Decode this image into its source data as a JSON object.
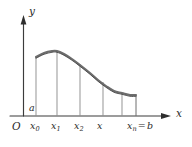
{
  "figure": {
    "axes": {
      "y_label": "y",
      "x_label": "x",
      "origin_label": "O"
    },
    "labels": {
      "lower_limit": "a",
      "tick_0_base": "x",
      "tick_0_sub": "0",
      "tick_1_base": "x",
      "tick_1_sub": "1",
      "tick_2_base": "x",
      "tick_2_sub": "2",
      "tick_3_base": "x",
      "tick_n_base": "x",
      "tick_n_sub": "n",
      "equals": "=",
      "upper_limit": "b"
    },
    "colors": {
      "background": "#ffffff",
      "axis": "#3b3b3b",
      "ordinate": "#8e8e8e",
      "curve_outer": "#6d6d6d",
      "curve_inner": "#3f3f3f",
      "text": "#2b2b2b"
    }
  },
  "chart_data": {
    "type": "line",
    "title": "",
    "xlabel": "x",
    "ylabel": "y",
    "xlim": [
      0,
      192
    ],
    "ylim": [
      0,
      147
    ],
    "grid": false,
    "legend": null,
    "x_tick_labels": [
      "x0",
      "x1",
      "x2",
      "x3",
      "xn = b"
    ],
    "x_tick_positions": [
      36,
      57,
      80,
      103,
      136
    ],
    "ordinate_positions": [
      36,
      57,
      80,
      103,
      122,
      136
    ],
    "ordinate_top_y": [
      57,
      52,
      64,
      82,
      93,
      95
    ],
    "axis_baseline_y": 116,
    "curve_points": [
      {
        "x": 36,
        "y": 57
      },
      {
        "x": 44,
        "y": 53
      },
      {
        "x": 52,
        "y": 51
      },
      {
        "x": 57,
        "y": 51
      },
      {
        "x": 64,
        "y": 54
      },
      {
        "x": 72,
        "y": 59
      },
      {
        "x": 80,
        "y": 65
      },
      {
        "x": 90,
        "y": 73
      },
      {
        "x": 98,
        "y": 80
      },
      {
        "x": 106,
        "y": 86
      },
      {
        "x": 114,
        "y": 91
      },
      {
        "x": 122,
        "y": 93
      },
      {
        "x": 130,
        "y": 95
      },
      {
        "x": 136,
        "y": 95
      }
    ]
  }
}
